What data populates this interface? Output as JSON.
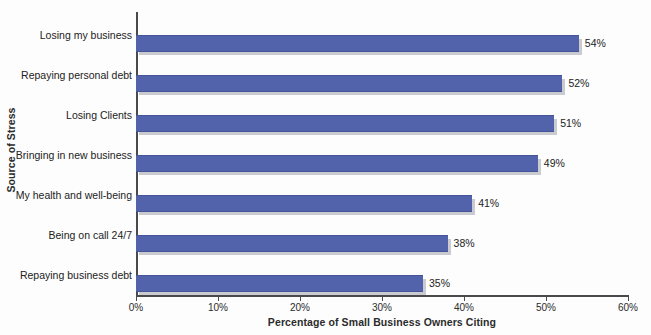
{
  "chart_data": {
    "type": "bar",
    "orientation": "horizontal",
    "title": "",
    "xlabel": "Percentage of Small Business Owners Citing",
    "ylabel": "Source of Stress",
    "categories": [
      "Losing my business",
      "Repaying personal debt",
      "Losing Clients",
      "Bringing in new business",
      "My health and well-being",
      "Being on call 24/7",
      "Repaying business debt"
    ],
    "values": [
      54,
      52,
      51,
      49,
      41,
      38,
      35
    ],
    "data_labels": [
      "54%",
      "52%",
      "51%",
      "49%",
      "41%",
      "38%",
      "35%"
    ],
    "xlim": [
      0,
      60
    ],
    "xticks": [
      0,
      10,
      20,
      30,
      40,
      50,
      60
    ],
    "xtick_labels": [
      "0%",
      "10%",
      "20%",
      "30%",
      "40%",
      "50%",
      "60%"
    ],
    "grid": false,
    "legend": null,
    "series_color": "#5262ab",
    "shadow_color": "#c9cbd0",
    "axis_color": "#4a4a4a",
    "background": "#fdfdfd"
  }
}
